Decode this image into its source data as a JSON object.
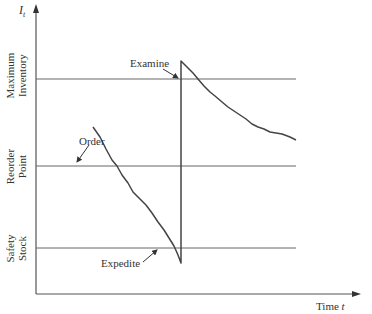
{
  "axes": {
    "y_label": "I",
    "y_subscript": "t",
    "x_label": "Time ",
    "x_label_var": "t"
  },
  "levels": {
    "maximum_inventory": {
      "line1": "Maximum",
      "line2": "Inventory"
    },
    "reorder_point": {
      "line1": "Reorder",
      "line2": "Point"
    },
    "safety_stock": {
      "line1": "Safety",
      "line2": "Stock"
    }
  },
  "annotations": {
    "order": "Order",
    "examine": "Examine",
    "expedite": "Expedite"
  },
  "colors": {
    "line": "#555555",
    "curve": "#444444",
    "text": "#333333"
  }
}
